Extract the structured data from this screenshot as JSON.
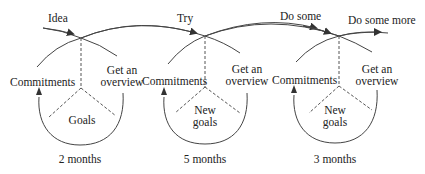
{
  "diagram": {
    "type": "iterative-cycles",
    "flow_labels": [
      "Idea",
      "Try",
      "Do some",
      "Do some more"
    ],
    "cycles": [
      {
        "left": "Commitments",
        "right_line1": "Get an",
        "right_line2": "overview",
        "center_line1": "Goals",
        "center_line2": "",
        "duration": "2 months"
      },
      {
        "left": "Commitments",
        "right_line1": "Get an",
        "right_line2": "overview",
        "center_line1": "New",
        "center_line2": "goals",
        "duration": "5 months"
      },
      {
        "left": "Commitments",
        "right_line1": "Get an",
        "right_line2": "overview",
        "center_line1": "New",
        "center_line2": "goals",
        "duration": "3 months"
      }
    ],
    "colors": {
      "line": "#333333",
      "text": "#222222",
      "background": "#ffffff"
    }
  }
}
